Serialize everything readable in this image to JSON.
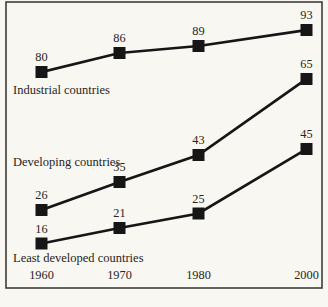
{
  "chart_data": {
    "type": "line",
    "title": "",
    "xlabel": "",
    "ylabel": "",
    "categories": [
      "1960",
      "1970",
      "1980",
      "2000"
    ],
    "series": [
      {
        "name": "Industrial countries",
        "values": [
          80,
          86,
          89,
          93
        ]
      },
      {
        "name": "Developing countries",
        "values": [
          26,
          35,
          43,
          65
        ]
      },
      {
        "name": "Least developed countries",
        "values": [
          16,
          21,
          25,
          45
        ]
      }
    ],
    "ylim": [
      0,
      100
    ],
    "grid": false,
    "legend_position": "inline-labels-on-plot",
    "marker_style": "filled-square",
    "point_labels": "value above each marker",
    "colors": {
      "ink": "#161616",
      "text": "#272522",
      "frame": "#3e3c39",
      "paper": "#f8f7f2"
    },
    "layout": {
      "canvas_px": [
        328,
        307
      ],
      "frame_px": [
        6,
        2,
        316,
        286
      ],
      "x_px": [
        41.5,
        119.5,
        198.5,
        306.5
      ],
      "series_y_px": [
        [
          72,
          53,
          46,
          30
        ],
        [
          210,
          182,
          155,
          79
        ],
        [
          243.5,
          228,
          213.5,
          149
        ]
      ],
      "series_label_anchor_px": [
        [
          13,
          94
        ],
        [
          13,
          166
        ],
        [
          13,
          262
        ]
      ],
      "axis_label_baseline_y": 279,
      "value_label_dy": -11,
      "marker_size": 12,
      "line_width": 2.7,
      "frame_stroke_width": 1.6
    }
  }
}
